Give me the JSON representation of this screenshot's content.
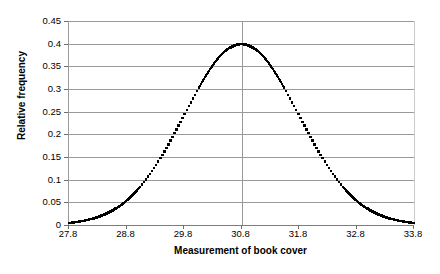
{
  "chart_data": {
    "type": "line",
    "title": "",
    "xlabel": "Measurement of book cover",
    "ylabel": "Relative frequency",
    "xlim": [
      27.8,
      33.8
    ],
    "ylim": [
      0,
      0.45
    ],
    "grid": true,
    "legend": null,
    "distribution": {
      "kind": "normal",
      "mean": 30.8,
      "sigma": 1.0,
      "peak_value": 0.4
    },
    "xticks": [
      "27.8",
      "28.8",
      "29.8",
      "30.8",
      "31.8",
      "32.8",
      "33.8"
    ],
    "xtick_values": [
      27.8,
      28.8,
      29.8,
      30.8,
      31.8,
      32.8,
      33.8
    ],
    "yticks": [
      "0",
      "0.05",
      "0.1",
      "0.15",
      "0.2",
      "0.25",
      "0.3",
      "0.35",
      "0.4",
      "0.45"
    ],
    "ytick_values": [
      0,
      0.05,
      0.1,
      0.15,
      0.2,
      0.25,
      0.3,
      0.35,
      0.4,
      0.45
    ],
    "series": [
      {
        "name": "Relative frequency",
        "marker": "square-dot",
        "color": "#000000",
        "x": [
          27.8,
          27.92,
          28.04,
          28.16,
          28.28,
          28.4,
          28.52,
          28.64,
          28.76,
          28.88,
          29.0,
          29.12,
          29.24,
          29.36,
          29.48,
          29.6,
          29.72,
          29.84,
          29.96,
          30.08,
          30.2,
          30.32,
          30.44,
          30.56,
          30.68,
          30.8,
          30.92,
          31.04,
          31.16,
          31.28,
          31.4,
          31.52,
          31.64,
          31.76,
          31.88,
          32.0,
          32.12,
          32.24,
          32.36,
          32.48,
          32.6,
          32.72,
          32.84,
          32.96,
          33.08,
          33.2,
          33.32,
          33.44,
          33.56,
          33.68,
          33.8
        ],
        "y": [
          0.0044,
          0.0063,
          0.0088,
          0.0122,
          0.0167,
          0.0224,
          0.0297,
          0.0387,
          0.0498,
          0.0629,
          0.0782,
          0.0957,
          0.1151,
          0.1362,
          0.1585,
          0.1814,
          0.2041,
          0.226,
          0.246,
          0.2636,
          0.278,
          0.2887,
          0.2954,
          0.2982,
          0.297,
          0.3989,
          0.297,
          0.2982,
          0.2954,
          0.2887,
          0.278,
          0.2636,
          0.246,
          0.226,
          0.2041,
          0.1814,
          0.1585,
          0.1362,
          0.1151,
          0.0957,
          0.0782,
          0.0629,
          0.0498,
          0.0387,
          0.0297,
          0.0224,
          0.0167,
          0.0122,
          0.0088,
          0.0063,
          0.0044
        ]
      }
    ]
  },
  "axes": {
    "x_title": "Measurement of book cover",
    "y_title": "Relative frequency"
  }
}
